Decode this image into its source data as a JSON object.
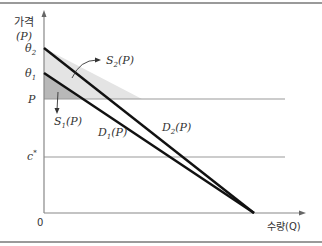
{
  "diagram": {
    "y_axis_label": "가격",
    "y_axis_symbol": "(P)",
    "x_axis_label": "수량(Q)",
    "origin_label": "0",
    "y_ticks": {
      "theta2": "θ",
      "theta2_sub": "2",
      "theta1": "θ",
      "theta1_sub": "1",
      "p": "P",
      "c_star": "c",
      "c_star_sup": "*"
    },
    "curve_labels": {
      "s2": {
        "main": "S",
        "sub": "2",
        "arg": "(P)"
      },
      "s1": {
        "main": "S",
        "sub": "1",
        "arg": "(P)"
      },
      "d1": {
        "main": "D",
        "sub": "1",
        "arg": "(P)"
      },
      "d2": {
        "main": "D",
        "sub": "2",
        "arg": "(P)"
      }
    },
    "colors": {
      "demand_line": "#111111",
      "axis": "#888888",
      "s2_region": "#e4e4e4",
      "s1_region": "#b8b8b8",
      "guide_line": "#999999"
    }
  }
}
